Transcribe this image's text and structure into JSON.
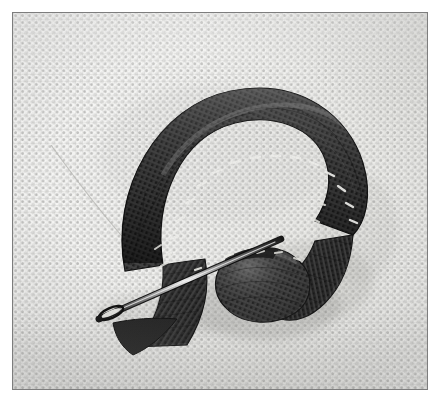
{
  "image": {
    "kind": "photograph",
    "color_mode": "black-and-white",
    "width": 448,
    "height": 411,
    "subject": "ribbon-embroidery-stitch-sample",
    "description": "Close-up monochrome photograph of a dark satin ribbon looped and couched onto pale Aida canvas, with a sewing needle lying through the ribbon at the lower left",
    "frame": {
      "margin_px": 12,
      "border_color": "#7d7d7d",
      "border_width_px": 1
    },
    "palette": {
      "canvas_light": "#f6f6f4",
      "canvas_mid": "#e9e9e6",
      "canvas_weave_dot": "#96968c",
      "ribbon_dark": "#232323",
      "ribbon_mid": "#3d3d3d",
      "ribbon_highlight": "#8e8e8e",
      "stitch_light": "#efefe9",
      "needle_steel": "#cfcfcf",
      "needle_dark": "#1b1b1b",
      "shadow": "#9a9a96"
    },
    "elements": [
      {
        "name": "canvas-fabric",
        "label": "Aida canvas ground fabric"
      },
      {
        "name": "ribbon-loop",
        "label": "Dark ribbon formed into a curled loop"
      },
      {
        "name": "couching-stitches",
        "label": "Row of light couching stitches along inner ribbon edge"
      },
      {
        "name": "ribbon-tail",
        "label": "Ribbon tail descending at lower left"
      },
      {
        "name": "ribbon-coil",
        "label": "Rolled ribbon coil at lower centre"
      },
      {
        "name": "sewing-needle",
        "label": "Sewing needle lying diagonally"
      },
      {
        "name": "needle-eye",
        "label": "Eye of the sewing needle"
      },
      {
        "name": "loose-thread",
        "label": "Fine loose thread crossing upper left canvas"
      },
      {
        "name": "cast-shadow",
        "label": "Soft shadow cast beneath the ribbon"
      }
    ]
  }
}
